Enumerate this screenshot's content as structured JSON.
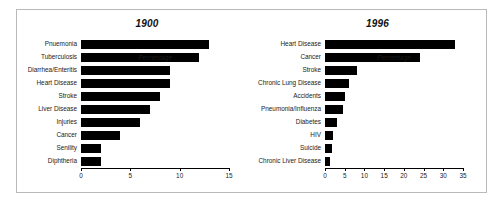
{
  "figure": {
    "panels": [
      {
        "id": "1900",
        "title": "1900",
        "axis_title": "Percentage",
        "ticks": [
          0,
          5,
          10,
          15
        ]
      },
      {
        "id": "1996",
        "title": "1996",
        "axis_title": "Percentage",
        "ticks": [
          0,
          5,
          10,
          15,
          20,
          25,
          30,
          35
        ]
      }
    ]
  },
  "chart_data": [
    {
      "type": "bar",
      "title": "1900",
      "orientation": "horizontal",
      "xlabel": "Percentage",
      "ylabel": "",
      "xlim": [
        0,
        15
      ],
      "xticks": [
        0,
        5,
        10,
        15
      ],
      "grid": false,
      "legend": "none",
      "bar_color": "#000000",
      "categories": [
        "Pnuemonia",
        "Tuberculosis",
        "Diarrhea/Enteritis",
        "Heart Disease",
        "Stroke",
        "Liver Disease",
        "Injuries",
        "Cancer",
        "Senility",
        "Diphtheria"
      ],
      "values": [
        13,
        12,
        9,
        9,
        8,
        7,
        6,
        4,
        2,
        2
      ]
    },
    {
      "type": "bar",
      "title": "1996",
      "orientation": "horizontal",
      "xlabel": "Percentage",
      "ylabel": "",
      "xlim": [
        0,
        35
      ],
      "xticks": [
        0,
        5,
        10,
        15,
        20,
        25,
        30,
        35
      ],
      "grid": false,
      "legend": "none",
      "bar_color": "#000000",
      "categories": [
        "Heart Disease",
        "Cancer",
        "Stroke",
        "Chronic Lung Disease",
        "Accidents",
        "Pneumonia/Influenza",
        "Diabetes",
        "HIV",
        "Suicide",
        "Chronic Liver Disease"
      ],
      "values": [
        33,
        24,
        8,
        6,
        5,
        4.5,
        3,
        2,
        1.8,
        1.2
      ]
    }
  ]
}
